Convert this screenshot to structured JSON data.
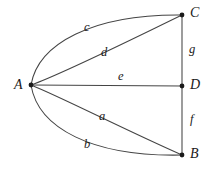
{
  "figure": {
    "width": 207,
    "height": 171,
    "background_color": "#ffffff",
    "stroke_color": "#444444",
    "node_color": "#1a1a1a",
    "text_color": "#1a1a1a"
  },
  "nodes": [
    {
      "id": "A",
      "label": "A",
      "x": 31,
      "y": 85,
      "label_x": 14,
      "label_y": 78
    },
    {
      "id": "C",
      "label": "C",
      "x": 182,
      "y": 15,
      "label_x": 190,
      "label_y": 6
    },
    {
      "id": "D",
      "label": "D",
      "x": 182,
      "y": 86,
      "label_x": 190,
      "label_y": 78
    },
    {
      "id": "B",
      "label": "B",
      "x": 182,
      "y": 155,
      "label_x": 190,
      "label_y": 147
    }
  ],
  "edges": [
    {
      "id": "c",
      "label": "c",
      "from": "A",
      "to": "C",
      "shape": "curve",
      "label_x": 84,
      "label_y": 21
    },
    {
      "id": "d",
      "label": "d",
      "from": "A",
      "to": "C",
      "shape": "curve",
      "label_x": 101,
      "label_y": 46
    },
    {
      "id": "e",
      "label": "e",
      "from": "A",
      "to": "D",
      "shape": "straight",
      "label_x": 118,
      "label_y": 70
    },
    {
      "id": "a",
      "label": "a",
      "from": "A",
      "to": "B",
      "shape": "curve",
      "label_x": 99,
      "label_y": 110
    },
    {
      "id": "b",
      "label": "b",
      "from": "A",
      "to": "B",
      "shape": "curve",
      "label_x": 84,
      "label_y": 138
    },
    {
      "id": "g",
      "label": "g",
      "from": "C",
      "to": "D",
      "shape": "straight",
      "label_x": 189,
      "label_y": 43
    },
    {
      "id": "f",
      "label": "f",
      "from": "D",
      "to": "B",
      "shape": "straight",
      "label_x": 190,
      "label_y": 113
    }
  ]
}
